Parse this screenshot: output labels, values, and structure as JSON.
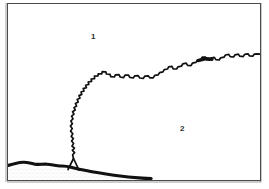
{
  "figure": {
    "type": "line-drawing-map",
    "width": 269,
    "height": 189,
    "background_color": "#ffffff",
    "frame": {
      "name": "figure-border",
      "stroke_color": "#4a4a4a",
      "shadow_color": "#8a8a8a",
      "x": 7,
      "y": 3,
      "width": 254,
      "height": 178,
      "stroke_width": 1
    },
    "ink_color": "#111111",
    "labels": [
      {
        "id": "1",
        "text": "1",
        "x": 91,
        "y": 33,
        "region": "upper-area"
      },
      {
        "id": "2",
        "text": "2",
        "x": 180,
        "y": 125,
        "region": "lower-area"
      }
    ],
    "features": [
      {
        "name": "jagged-boundary-line",
        "description": "irregular zigzag contact line running from lower-left to right edge separating region 1 from region 2",
        "stroke_width": 1.6,
        "stroke_color": "#111111"
      },
      {
        "name": "basal-thick-line",
        "description": "thick tapering line along the lower-left portion, terminating near the middle of the frame",
        "stroke_color": "#111111"
      },
      {
        "name": "stippled-texture-area",
        "description": "light speckled / stippled fill band below the basal line in the lower-left corner",
        "fill_color": "#d9d9d9"
      },
      {
        "name": "triangular-notch",
        "description": "small triangular outcrop notch where the jagged line meets the basal line",
        "stroke_color": "#111111"
      }
    ]
  }
}
